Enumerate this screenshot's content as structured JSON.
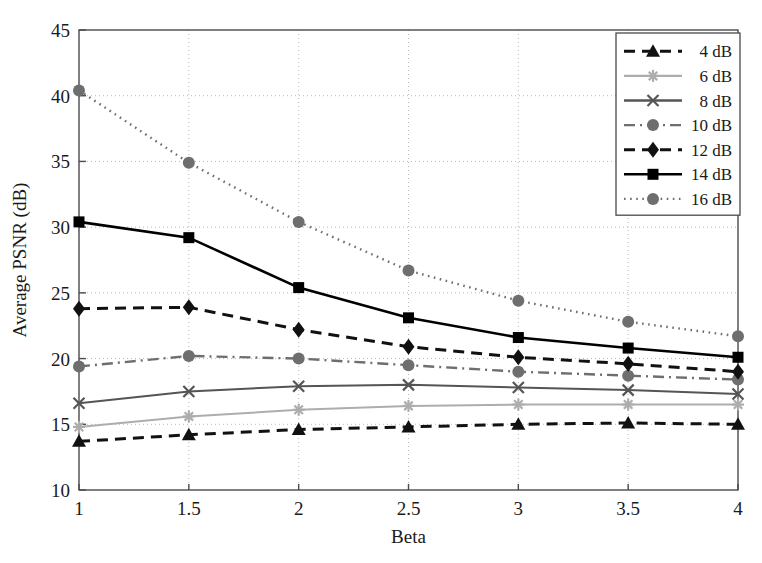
{
  "chart_data": {
    "type": "line",
    "title": "",
    "xlabel": "Beta",
    "ylabel": "Average PSNR (dB)",
    "x": [
      1,
      1.5,
      2,
      2.5,
      3,
      3.5,
      4
    ],
    "xlim": [
      1,
      4
    ],
    "ylim": [
      10,
      45
    ],
    "xticks": [
      "1",
      "1.5",
      "2",
      "2.5",
      "3",
      "3.5",
      "4"
    ],
    "yticks": [
      "10",
      "15",
      "20",
      "25",
      "30",
      "35",
      "40",
      "45"
    ],
    "grid": true,
    "legend_position": "upper right",
    "series": [
      {
        "name": "4 dB",
        "values": [
          13.7,
          14.2,
          14.6,
          14.8,
          15.0,
          15.1,
          15.0
        ],
        "color": "#111111",
        "style": "dashed",
        "marker": "triangle"
      },
      {
        "name": "6 dB",
        "values": [
          14.8,
          15.6,
          16.1,
          16.4,
          16.5,
          16.5,
          16.5
        ],
        "color": "#adadad",
        "style": "solid",
        "marker": "star"
      },
      {
        "name": "8 dB",
        "values": [
          16.6,
          17.5,
          17.9,
          18.0,
          17.8,
          17.6,
          17.3
        ],
        "color": "#555555",
        "style": "solid",
        "marker": "x"
      },
      {
        "name": "10 dB",
        "values": [
          19.4,
          20.2,
          20.0,
          19.5,
          19.0,
          18.7,
          18.4
        ],
        "color": "#6e6e6e",
        "style": "dashdot",
        "marker": "circle"
      },
      {
        "name": "12 dB",
        "values": [
          23.8,
          23.9,
          22.2,
          20.9,
          20.1,
          19.6,
          19.0
        ],
        "color": "#111111",
        "style": "dashed",
        "marker": "diamond"
      },
      {
        "name": "14 dB",
        "values": [
          30.4,
          29.2,
          25.4,
          23.1,
          21.6,
          20.8,
          20.1
        ],
        "color": "#000000",
        "style": "solid",
        "marker": "square"
      },
      {
        "name": "16 dB",
        "values": [
          40.4,
          34.9,
          30.4,
          26.7,
          24.4,
          22.8,
          21.7
        ],
        "color": "#6e6e6e",
        "style": "dotted",
        "marker": "circle"
      }
    ]
  }
}
